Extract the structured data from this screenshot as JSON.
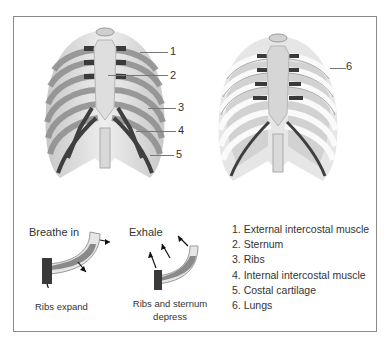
{
  "diagram": {
    "left_figure": {
      "name": "Rib cage with intercostal muscles",
      "callouts": [
        "1",
        "2",
        "3",
        "4",
        "5"
      ]
    },
    "right_figure": {
      "name": "Rib cage with lungs",
      "callouts": [
        "6"
      ]
    },
    "inhale": {
      "title": "Breathe in",
      "caption": "Ribs expand"
    },
    "exhale": {
      "title": "Exhale",
      "caption_line1": "Ribs and sternum",
      "caption_line2": "depress"
    },
    "legend": [
      "1. External intercostal muscle",
      "2. Sternum",
      "3. Ribs",
      "4. Internal intercostal muscle",
      "5. Costal cartilage",
      "6. Lungs"
    ],
    "colors": {
      "bone": "#dcdcdc",
      "bone_light": "#efefef",
      "muscle": "#4a4a4a",
      "muscle_mid": "#7a7a7a",
      "frame": "#8a8a8a"
    }
  }
}
